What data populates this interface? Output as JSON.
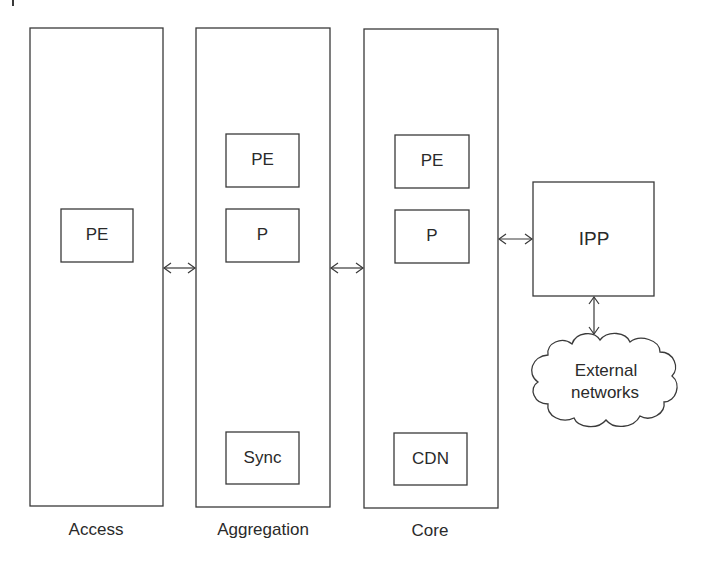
{
  "diagram": {
    "columns": [
      {
        "id": "access",
        "label": "Access",
        "nodes": [
          {
            "id": "access-pe",
            "label": "PE"
          }
        ]
      },
      {
        "id": "aggregation",
        "label": "Aggregation",
        "nodes": [
          {
            "id": "agg-pe",
            "label": "PE"
          },
          {
            "id": "agg-p",
            "label": "P"
          },
          {
            "id": "agg-sync",
            "label": "Sync"
          }
        ]
      },
      {
        "id": "core",
        "label": "Core",
        "nodes": [
          {
            "id": "core-pe",
            "label": "PE"
          },
          {
            "id": "core-p",
            "label": "P"
          },
          {
            "id": "core-cdn",
            "label": "CDN"
          }
        ]
      }
    ],
    "ipp": {
      "label": "IPP"
    },
    "cloud": {
      "line1": "External",
      "line2": "networks"
    },
    "connections": [
      {
        "from": "access",
        "to": "aggregation",
        "type": "bidirectional"
      },
      {
        "from": "aggregation",
        "to": "core",
        "type": "bidirectional"
      },
      {
        "from": "core",
        "to": "ipp",
        "type": "bidirectional"
      },
      {
        "from": "ipp",
        "to": "external-networks",
        "type": "bidirectional"
      }
    ]
  }
}
